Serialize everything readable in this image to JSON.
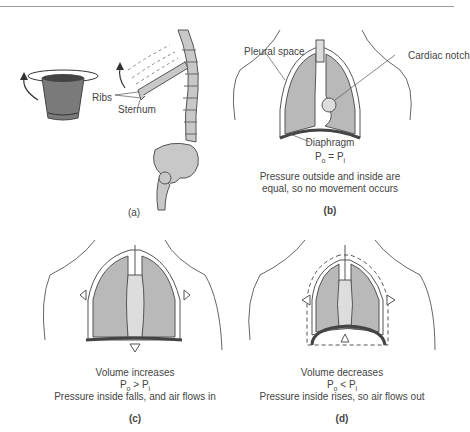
{
  "figure": {
    "panels": [
      {
        "id": "a",
        "label": "(a)",
        "annotations": [
          "Ribs",
          "Sternum"
        ],
        "depicts": [
          "bucket-handle analogy",
          "spine",
          "ribs",
          "pelvis"
        ]
      },
      {
        "id": "b",
        "label": "(b)",
        "annotations": [
          "Pleural space",
          "Cardiac notch",
          "Diaphragm"
        ],
        "pressure_eq": {
          "lhs": "P",
          "lhs_sub": "o",
          "op": "=",
          "rhs": "P",
          "rhs_sub": "i"
        },
        "caption_lines": [
          "Pressure outside and inside are",
          "equal, so no movement occurs"
        ]
      },
      {
        "id": "c",
        "label": "(c)",
        "pressure_eq": {
          "lhs": "P",
          "lhs_sub": "o",
          "op": ">",
          "rhs": "P",
          "rhs_sub": "i"
        },
        "caption_lines": [
          "Volume increases",
          "Pressure inside falls, and air flows in"
        ]
      },
      {
        "id": "d",
        "label": "(d)",
        "pressure_eq": {
          "lhs": "P",
          "lhs_sub": "o",
          "op": "<",
          "rhs": "P",
          "rhs_sub": "i"
        },
        "caption_lines": [
          "Volume decreases",
          "Pressure inside rises, so air flows out"
        ]
      }
    ]
  },
  "colors": {
    "lung": "#b9b9b9",
    "outline": "#555555",
    "bone": "#c8c8c8",
    "bucket": "#7a7a7a"
  }
}
